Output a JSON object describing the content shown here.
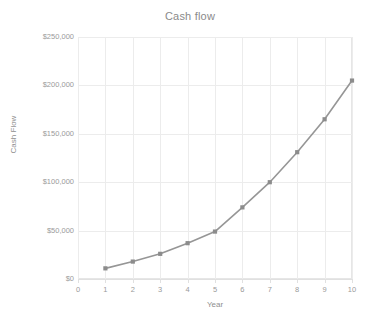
{
  "chart_data": {
    "type": "line",
    "title": "Cash flow",
    "xlabel": "Year",
    "ylabel": "Cash Flow",
    "x": [
      1,
      2,
      3,
      4,
      5,
      6,
      7,
      8,
      9,
      10
    ],
    "values": [
      11000,
      18000,
      26000,
      37000,
      49000,
      74000,
      100000,
      131000,
      165000,
      205000
    ],
    "series": [
      {
        "name": "Cash Flow",
        "values": [
          11000,
          18000,
          26000,
          37000,
          49000,
          74000,
          100000,
          131000,
          165000,
          205000
        ]
      }
    ],
    "xlim": [
      0,
      10
    ],
    "ylim": [
      0,
      250000
    ],
    "xticks": [
      "0",
      "1",
      "2",
      "3",
      "4",
      "5",
      "6",
      "7",
      "8",
      "9",
      "10"
    ],
    "xtick_values": [
      0,
      1,
      2,
      3,
      4,
      5,
      6,
      7,
      8,
      9,
      10
    ],
    "yticks": [
      "$0",
      "$50,000",
      "$100,000",
      "$150,000",
      "$200,000",
      "$250,000"
    ],
    "ytick_values": [
      0,
      50000,
      100000,
      150000,
      200000,
      250000
    ],
    "grid": true,
    "legend": false,
    "legend_position": "none",
    "markers": "square",
    "colors": {
      "line": "#969696",
      "marker": "#8c8c8c",
      "grid": "#ececec",
      "frame": "#e6e6e6",
      "title_text": "#8a8a8a",
      "tick_text": "#9a9a9a",
      "axis_title_text": "#8f8f8f",
      "background": "#ffffff"
    }
  }
}
